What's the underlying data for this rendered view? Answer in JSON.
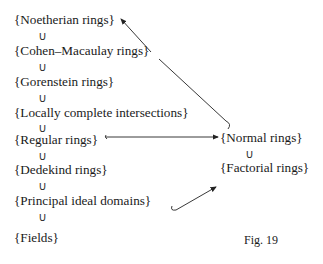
{
  "diagram": {
    "left_chain": [
      {
        "label": "{Noetherian rings}"
      },
      {
        "label": "{Cohen–Macaulay rings}"
      },
      {
        "label": "{Gorenstein rings}"
      },
      {
        "label": "{Locally complete intersections}"
      },
      {
        "label": "{Regular rings}"
      },
      {
        "label": "{Dedekind rings}"
      },
      {
        "label": "{Principal ideal domains}"
      },
      {
        "label": "{Fields}"
      }
    ],
    "right_chain": [
      {
        "label": "{Normal rings}"
      },
      {
        "label": "{Factorial rings}"
      }
    ],
    "subset_symbol": "∪",
    "arrows": [
      {
        "from": "{Regular rings}",
        "to": "{Normal rings}"
      },
      {
        "from": "{Normal rings}",
        "to": "{Noetherian rings}"
      },
      {
        "from": "{Principal ideal domains}",
        "to": "{Factorial rings}"
      }
    ],
    "caption": "Fig. 19"
  }
}
